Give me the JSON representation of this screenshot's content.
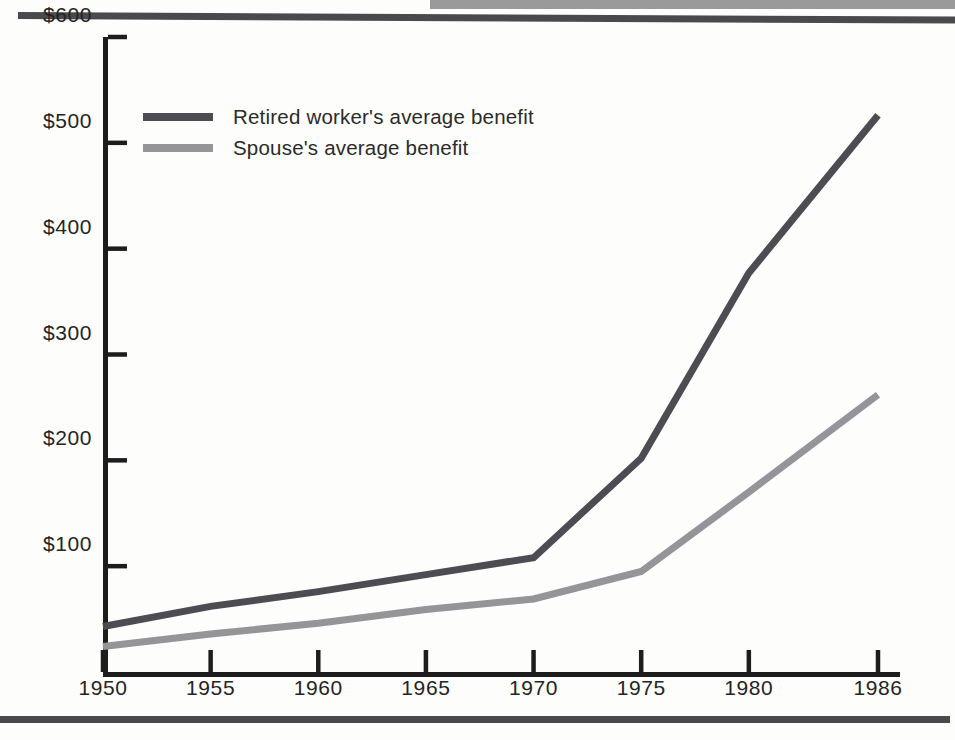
{
  "page": {
    "background": "#fdfdfc",
    "rules": {
      "top_band_color": "#9a9a9a",
      "top_rule_color": "#4a4a4d",
      "bottom_rule_color": "#4a4a4d"
    }
  },
  "legend": {
    "position": "inside-top-left",
    "entries": [
      {
        "label": "Retired worker's average benefit",
        "color": "#4c4c52",
        "swatch_name": "legend-swatch-retired-worker"
      },
      {
        "label": "Spouse's average benefit",
        "color": "#949499",
        "swatch_name": "legend-swatch-spouse"
      }
    ]
  },
  "axes": {
    "y_ticks": [
      "$100",
      "$200",
      "$300",
      "$400",
      "$500",
      "$600"
    ],
    "x_ticks": [
      "1950",
      "1955",
      "1960",
      "1965",
      "1970",
      "1975",
      "1980",
      "1986"
    ],
    "axis_color": "#1d1d1d"
  },
  "chart_data": {
    "type": "line",
    "title": "",
    "subtitle": "",
    "xlabel": "",
    "ylabel": "",
    "x": [
      1950,
      1955,
      1960,
      1965,
      1970,
      1975,
      1980,
      1986
    ],
    "categories": [
      "1950",
      "1955",
      "1960",
      "1965",
      "1970",
      "1975",
      "1980",
      "1986"
    ],
    "xlim": [
      1950,
      1986
    ],
    "ylim": [
      0,
      600
    ],
    "y_tick_values": [
      100,
      200,
      300,
      400,
      500,
      600
    ],
    "y_tick_labels": [
      "$100",
      "$200",
      "$300",
      "$400",
      "$500",
      "$600"
    ],
    "x_tick_labels": [
      "1950",
      "1955",
      "1960",
      "1965",
      "1970",
      "1975",
      "1980",
      "1986"
    ],
    "grid": false,
    "legend_position": "upper left inside",
    "series": [
      {
        "name": "Retired worker's average benefit",
        "color": "#4c4c52",
        "values": [
          43,
          62,
          76,
          92,
          108,
          202,
          377,
          526
        ]
      },
      {
        "name": "Spouse's average benefit",
        "color": "#949499",
        "values": [
          24,
          36,
          46,
          59,
          69,
          95,
          170,
          262
        ]
      }
    ],
    "annotations": []
  }
}
